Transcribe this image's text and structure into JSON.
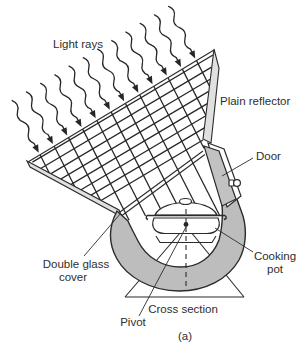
{
  "diagram": {
    "type": "solar-cooker-cross-section",
    "caption": "(a)",
    "labels": {
      "light_rays": "Light rays",
      "plain_reflector": "Plain reflector",
      "door": "Door",
      "double_glass_line1": "Double glass",
      "double_glass_line2": "cover",
      "cooking_pot_line1": "Cooking",
      "cooking_pot_line2": "pot",
      "cross_section": "Cross section",
      "pivot": "Pivot"
    },
    "elements": [
      "light-ray-arrows (12 wavy arrows with arrowheads)",
      "incident-ray-grid",
      "reflected-ray-grid",
      "plain-reflector-panel",
      "left-aperture-panel",
      "double-glass-cover-line",
      "u-shaped-cooker-body",
      "door-panel-with-knob",
      "cooking-pot-with-lid-on-trivet",
      "pivot-dot-and-dashed-axis",
      "stand-triangle"
    ],
    "colors": {
      "background": "#ffffff",
      "body_gray": "#bdbdbd",
      "panel_gray": "#e0e0e0",
      "door_gray": "#c2c2c2",
      "ink": "#2b2b2b"
    }
  }
}
